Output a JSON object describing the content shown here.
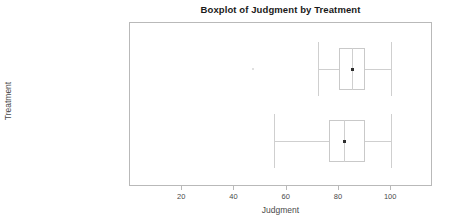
{
  "chart_data": {
    "type": "box",
    "title": "Boxplot of Judgment by Treatment",
    "xlabel": "Judgment",
    "ylabel": "Treatment",
    "orientation": "horizontal",
    "xlim": [
      0,
      116
    ],
    "xticks": [
      20,
      40,
      60,
      80,
      100
    ],
    "xtick_labels": [
      "20",
      "40",
      "60",
      "80",
      "100"
    ],
    "grid": false,
    "legend": false,
    "categories": [
      "Added Mineral Supplement",
      "Regular Feed"
    ],
    "boxes": [
      {
        "category": "Added Mineral Supplement",
        "whisker_low": 72,
        "q1": 80,
        "median": 85,
        "q3": 90,
        "whisker_high": 100,
        "mean": 85,
        "outliers": [
          47
        ]
      },
      {
        "category": "Regular Feed",
        "whisker_low": 55,
        "q1": 76,
        "median": 82,
        "q3": 90,
        "whisker_high": 100,
        "mean": 82,
        "outliers": []
      }
    ]
  },
  "colors": {
    "frame": "#b9b9b9",
    "box_line": "#c9c9c9",
    "whisker": "#cfcfcf",
    "mean_marker": "#2e2e2e",
    "outlier": "#d6d6d6",
    "title_text": "#1a1a1a",
    "axis_text": "#4a4a4a",
    "background": "#ffffff"
  }
}
